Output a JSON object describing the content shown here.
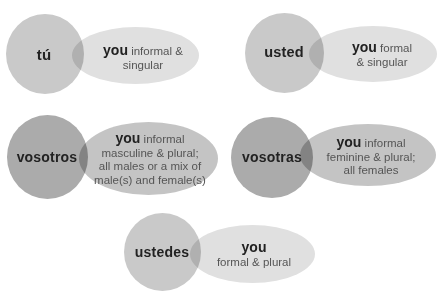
{
  "header": {
    "cut_text": ""
  },
  "colors": {
    "light_circle": "#c9c9c9",
    "dark_circle": "#ababab",
    "light_ellipse": "#e0e0e0",
    "dark_ellipse": "#c4c4c4"
  },
  "pronouns": [
    {
      "pronoun": "tú",
      "you": "you",
      "line1": "informal &",
      "line2": "singular"
    },
    {
      "pronoun": "usted",
      "you": "you",
      "line1": "formal",
      "line2": "& singular"
    },
    {
      "pronoun": "vosotros",
      "you": "you",
      "line1": "informal",
      "line2": "masculine & plural;",
      "line3": "all males or a mix of",
      "line4": "male(s) and female(s)"
    },
    {
      "pronoun": "vosotras",
      "you": "you",
      "line1": "informal",
      "line2": "feminine & plural;",
      "line3": "all females"
    },
    {
      "pronoun": "ustedes",
      "you": "you",
      "line1": "",
      "line2": "formal & plural"
    }
  ]
}
